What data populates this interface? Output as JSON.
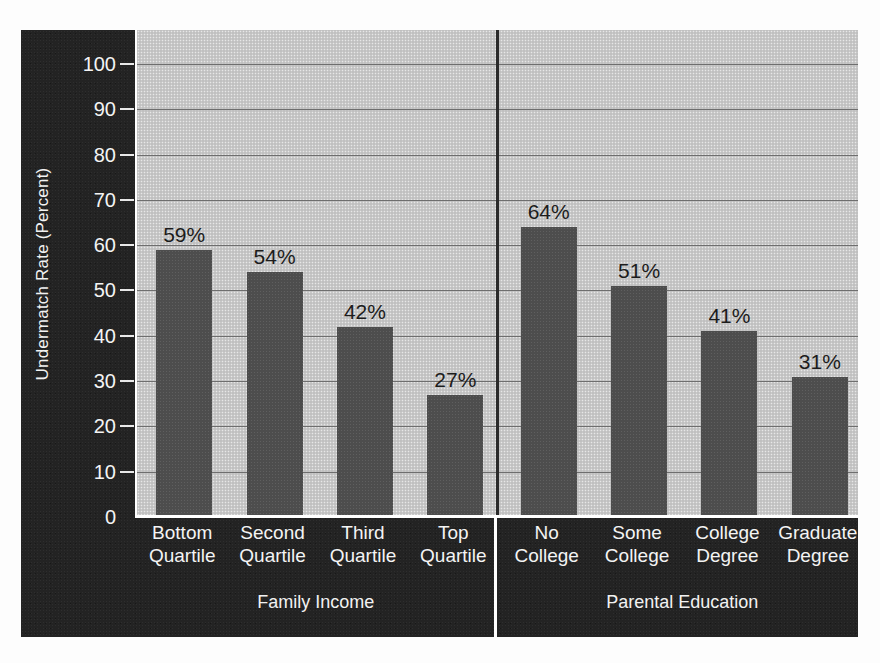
{
  "chart_data": {
    "type": "bar",
    "title": "",
    "xlabel": "",
    "ylabel": "Undermatch Rate (Percent)",
    "ylim": [
      0,
      100
    ],
    "ytick_labels": [
      "100",
      "90",
      "80",
      "70",
      "60",
      "50",
      "40",
      "30",
      "20",
      "10",
      "0"
    ],
    "ytick_values": [
      100,
      90,
      80,
      70,
      60,
      50,
      40,
      30,
      20,
      10,
      0
    ],
    "grid": true,
    "legend": "none",
    "groups": [
      {
        "name": "Family Income",
        "categories": [
          "Bottom Quartile",
          "Second Quartile",
          "Third Quartile",
          "Top Quartile"
        ],
        "values": [
          59,
          54,
          42,
          27
        ],
        "data_labels": [
          "59%",
          "54%",
          "42%",
          "27%"
        ]
      },
      {
        "name": "Parental Education",
        "categories": [
          "No College",
          "Some College",
          "College Degree",
          "Graduate Degree"
        ],
        "values": [
          64,
          51,
          41,
          31
        ],
        "data_labels": [
          "64%",
          "51%",
          "41%",
          "31%"
        ]
      }
    ],
    "categories": [
      "Bottom Quartile",
      "Second Quartile",
      "Third Quartile",
      "Top Quartile",
      "No College",
      "Some College",
      "College Degree",
      "Graduate Degree"
    ],
    "values": [
      59,
      54,
      42,
      27,
      64,
      51,
      41,
      31
    ],
    "colors": {
      "bar_fill": "#4d4d4d",
      "plot_background": "#c9c9c9",
      "panel_background": "#232323",
      "gridline": "#6e6e6e",
      "tick_text": "#f4f4f4",
      "data_label_text": "#1c1c1c",
      "divider": "#2a2a2a",
      "axis_line": "#ffffff"
    }
  },
  "axis": {
    "y_title": "Undermatch Rate (Percent)",
    "ticks": [
      {
        "label": "100"
      },
      {
        "label": "90"
      },
      {
        "label": "80"
      },
      {
        "label": "70"
      },
      {
        "label": "60"
      },
      {
        "label": "50"
      },
      {
        "label": "40"
      },
      {
        "label": "30"
      },
      {
        "label": "20"
      },
      {
        "label": "10"
      },
      {
        "label": "0"
      }
    ]
  },
  "bars": [
    {
      "label_top": "Bottom",
      "label_bottom": "Quartile",
      "value_label": "59%",
      "value": 59
    },
    {
      "label_top": "Second",
      "label_bottom": "Quartile",
      "value_label": "54%",
      "value": 54
    },
    {
      "label_top": "Third",
      "label_bottom": "Quartile",
      "value_label": "42%",
      "value": 42
    },
    {
      "label_top": "Top",
      "label_bottom": "Quartile",
      "value_label": "27%",
      "value": 27
    },
    {
      "label_top": "No",
      "label_bottom": "College",
      "value_label": "64%",
      "value": 64
    },
    {
      "label_top": "Some",
      "label_bottom": "College",
      "value_label": "51%",
      "value": 51
    },
    {
      "label_top": "College",
      "label_bottom": "Degree",
      "value_label": "41%",
      "value": 41
    },
    {
      "label_top": "Graduate",
      "label_bottom": "Degree",
      "value_label": "31%",
      "value": 31
    }
  ],
  "group_titles": [
    {
      "label": "Family Income"
    },
    {
      "label": "Parental Education"
    }
  ]
}
